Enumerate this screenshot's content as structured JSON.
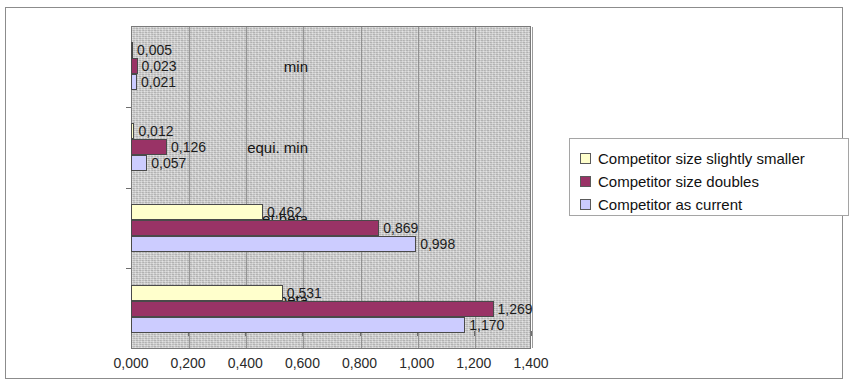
{
  "chart_data": {
    "type": "bar",
    "orientation": "horizontal",
    "title": "",
    "xlabel": "",
    "ylabel": "",
    "categories": [
      "min",
      "equi. min",
      "Asset beta\nmax",
      "Equity beta\nmax"
    ],
    "series": [
      {
        "name": "Competitor size slightly smaller",
        "color": "#ffffcc",
        "values": [
          0.005,
          0.012,
          0.462,
          0.531
        ],
        "labels": [
          "0,005",
          "0,012",
          "0,462",
          "0,531"
        ]
      },
      {
        "name": "Competitor size doubles",
        "color": "#993366",
        "values": [
          0.023,
          0.126,
          0.869,
          1.269
        ],
        "labels": [
          "0,023",
          "0,126",
          "0,869",
          "1,269"
        ]
      },
      {
        "name": "Competitor as current",
        "color": "#ccccff",
        "values": [
          0.021,
          0.057,
          0.998,
          1.17
        ],
        "labels": [
          "0,021",
          "0,057",
          "0,998",
          "1,170"
        ]
      }
    ],
    "xlim": [
      0.0,
      1.4
    ],
    "xticks": [
      0.0,
      0.2,
      0.4,
      0.6,
      0.8,
      1.0,
      1.2,
      1.4
    ],
    "xtick_labels": [
      "0,000",
      "0,200",
      "0,400",
      "0,600",
      "0,800",
      "1,000",
      "1,200",
      "1,400"
    ],
    "grid": true,
    "grid_axis": "x",
    "legend_position": "right",
    "plot_background": "#c9c9c9",
    "decimal_separator": ","
  },
  "legend": {
    "items": [
      {
        "label": "Competitor size slightly smaller",
        "color": "#ffffcc"
      },
      {
        "label": "Competitor size doubles",
        "color": "#993366"
      },
      {
        "label": "Competitor as current",
        "color": "#ccccff"
      }
    ]
  }
}
